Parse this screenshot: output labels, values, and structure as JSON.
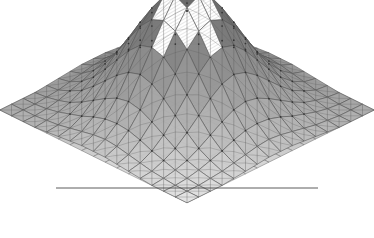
{
  "figure": {
    "title": "",
    "background_color": "#ffffff",
    "width": 374,
    "height": 238,
    "render_style": "wireframe-mesh-surface"
  },
  "chart_data": {
    "type": "heatmap",
    "title": "",
    "subtitle": "",
    "xlabel": "",
    "ylabel": "",
    "zlabel": "",
    "projection": "3d-surface-mesh",
    "grid": true,
    "legend": "none",
    "colormap": {
      "name": "grayscale",
      "low": "#ffffff",
      "mid": "#a8a8a8",
      "high": "#6e6e6e",
      "edge": "#4a4a4a",
      "highlight": "#ffffff"
    },
    "axis_ranges": {
      "x": [
        0,
        16
      ],
      "y": [
        0,
        16
      ],
      "z": [
        0,
        1
      ]
    },
    "nx": 17,
    "ny": 17,
    "cell_w": 23.4,
    "cell_h": 11.6,
    "surface_comment": "z values are a radially-symmetric bump peaking at the grid center",
    "peak": {
      "x": 8,
      "y": 8,
      "z": 1.0
    },
    "z_rows": [
      [
        0.0,
        0.0,
        0.0,
        0.0,
        0.01,
        0.02,
        0.03,
        0.04,
        0.04,
        0.04,
        0.03,
        0.02,
        0.01,
        0.0,
        0.0,
        0.0,
        0.0
      ],
      [
        0.0,
        0.0,
        0.0,
        0.01,
        0.02,
        0.04,
        0.06,
        0.08,
        0.09,
        0.08,
        0.06,
        0.04,
        0.02,
        0.01,
        0.0,
        0.0,
        0.0
      ],
      [
        0.0,
        0.0,
        0.01,
        0.03,
        0.06,
        0.09,
        0.13,
        0.16,
        0.17,
        0.16,
        0.13,
        0.09,
        0.06,
        0.03,
        0.01,
        0.0,
        0.0
      ],
      [
        0.0,
        0.01,
        0.03,
        0.06,
        0.11,
        0.17,
        0.23,
        0.28,
        0.3,
        0.28,
        0.23,
        0.17,
        0.11,
        0.06,
        0.03,
        0.01,
        0.0
      ],
      [
        0.01,
        0.02,
        0.06,
        0.11,
        0.19,
        0.28,
        0.37,
        0.44,
        0.47,
        0.44,
        0.37,
        0.28,
        0.19,
        0.11,
        0.06,
        0.02,
        0.01
      ],
      [
        0.02,
        0.04,
        0.09,
        0.17,
        0.28,
        0.4,
        0.52,
        0.61,
        0.64,
        0.61,
        0.52,
        0.4,
        0.28,
        0.17,
        0.09,
        0.04,
        0.02
      ],
      [
        0.03,
        0.06,
        0.13,
        0.23,
        0.37,
        0.52,
        0.67,
        0.77,
        0.81,
        0.77,
        0.67,
        0.52,
        0.37,
        0.23,
        0.13,
        0.06,
        0.03
      ],
      [
        0.04,
        0.08,
        0.16,
        0.28,
        0.44,
        0.61,
        0.77,
        0.91,
        0.96,
        0.91,
        0.77,
        0.61,
        0.44,
        0.28,
        0.16,
        0.08,
        0.04
      ],
      [
        0.04,
        0.09,
        0.17,
        0.3,
        0.47,
        0.64,
        0.81,
        0.96,
        1.0,
        0.96,
        0.81,
        0.64,
        0.47,
        0.3,
        0.17,
        0.09,
        0.04
      ],
      [
        0.04,
        0.08,
        0.16,
        0.28,
        0.44,
        0.61,
        0.77,
        0.91,
        0.96,
        0.91,
        0.77,
        0.61,
        0.44,
        0.28,
        0.16,
        0.08,
        0.04
      ],
      [
        0.03,
        0.06,
        0.13,
        0.23,
        0.37,
        0.52,
        0.67,
        0.77,
        0.81,
        0.77,
        0.67,
        0.52,
        0.37,
        0.23,
        0.13,
        0.06,
        0.03
      ],
      [
        0.02,
        0.04,
        0.09,
        0.17,
        0.28,
        0.4,
        0.52,
        0.61,
        0.64,
        0.61,
        0.52,
        0.4,
        0.28,
        0.17,
        0.09,
        0.04,
        0.02
      ],
      [
        0.01,
        0.02,
        0.06,
        0.11,
        0.19,
        0.28,
        0.37,
        0.44,
        0.47,
        0.44,
        0.37,
        0.28,
        0.19,
        0.11,
        0.06,
        0.02,
        0.01
      ],
      [
        0.0,
        0.01,
        0.03,
        0.06,
        0.11,
        0.17,
        0.23,
        0.28,
        0.3,
        0.28,
        0.23,
        0.17,
        0.11,
        0.06,
        0.03,
        0.01,
        0.0
      ],
      [
        0.0,
        0.0,
        0.01,
        0.03,
        0.06,
        0.09,
        0.13,
        0.16,
        0.17,
        0.16,
        0.13,
        0.09,
        0.06,
        0.03,
        0.01,
        0.0,
        0.0
      ],
      [
        0.0,
        0.0,
        0.0,
        0.01,
        0.02,
        0.04,
        0.06,
        0.08,
        0.09,
        0.08,
        0.06,
        0.04,
        0.02,
        0.01,
        0.0,
        0.0,
        0.0
      ],
      [
        0.0,
        0.0,
        0.0,
        0.0,
        0.01,
        0.02,
        0.03,
        0.04,
        0.04,
        0.04,
        0.03,
        0.02,
        0.01,
        0.0,
        0.0,
        0.0,
        0.0
      ]
    ],
    "tick_labels": {
      "x": [],
      "y": [],
      "z": []
    },
    "annotations": []
  },
  "geometry": {
    "base_origin_x": 187,
    "base_origin_y": 110,
    "lattice_dx": 11.7,
    "lattice_dy": 5.8,
    "z_scale": 125,
    "baseline_y": 188,
    "baseline_x0": 56,
    "baseline_x1": 318,
    "apex_x": 187,
    "apex_y": 11
  },
  "highlight_region": {
    "label": "apex-hatched-cells",
    "fill": "#ffffff",
    "hatch": true,
    "cells": [
      {
        "i": 7,
        "j": 7
      },
      {
        "i": 8,
        "j": 7
      },
      {
        "i": 9,
        "j": 7
      },
      {
        "i": 7,
        "j": 8
      },
      {
        "i": 9,
        "j": 8
      },
      {
        "i": 7,
        "j": 9
      },
      {
        "i": 8,
        "j": 9
      },
      {
        "i": 9,
        "j": 9
      },
      {
        "i": 8,
        "j": 6
      },
      {
        "i": 6,
        "j": 8
      },
      {
        "i": 10,
        "j": 8
      },
      {
        "i": 8,
        "j": 10
      }
    ]
  }
}
